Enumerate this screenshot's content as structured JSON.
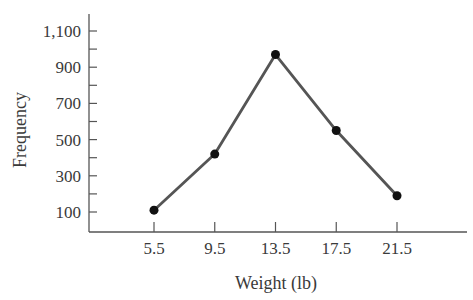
{
  "chart_data": {
    "type": "line",
    "title": "",
    "xlabel": "Weight (lb)",
    "ylabel": "Frequency",
    "categories": [
      "5.5",
      "9.5",
      "13.5",
      "17.5",
      "21.5"
    ],
    "x": [
      5.5,
      9.5,
      13.5,
      17.5,
      21.5
    ],
    "series": [
      {
        "name": "Frequency",
        "values": [
          110,
          420,
          970,
          550,
          190
        ]
      }
    ],
    "y_ticks": [
      100,
      300,
      500,
      700,
      900,
      1100
    ],
    "y_tick_labels": [
      "100",
      "300",
      "500",
      "700",
      "900",
      "1,100"
    ],
    "y_minor_ticks": [
      200,
      400,
      600,
      800,
      1000
    ],
    "ylim": [
      0,
      1200
    ],
    "grid": false,
    "legend": "none",
    "colors": {
      "line": "#555555",
      "marker": "#111111",
      "axis": "#555555"
    }
  }
}
